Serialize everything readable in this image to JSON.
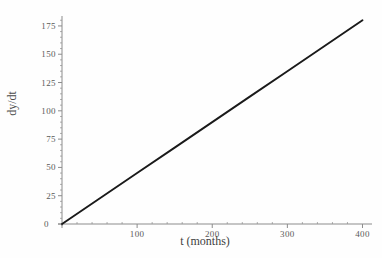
{
  "chart_data": {
    "type": "line",
    "title": "",
    "subtitle": "",
    "xlabel": "t (months)",
    "ylabel": "dy/dt",
    "xlim": [
      0,
      410
    ],
    "ylim": [
      0,
      182
    ],
    "grid": false,
    "legend": null,
    "x_ticks": [
      0,
      100,
      200,
      300,
      400
    ],
    "x_tick_labels": [
      "0",
      "100",
      "200",
      "300",
      "400"
    ],
    "y_ticks": [
      0,
      25,
      50,
      75,
      100,
      125,
      150,
      175
    ],
    "y_tick_labels": [
      "0",
      "25",
      "50",
      "75",
      "100",
      "125",
      "150",
      "175"
    ],
    "x_minor_tick_step": 20,
    "y_minor_tick_step": 5,
    "origin_label": "0",
    "series": [
      {
        "name": "dy/dt",
        "color": "#1a1a1a",
        "x": [
          0,
          50,
          100,
          150,
          200,
          250,
          300,
          350,
          400
        ],
        "y": [
          0,
          22.5,
          45,
          67.5,
          90,
          112.5,
          135,
          157.5,
          180
        ]
      }
    ],
    "slope": 0.45,
    "intercept": 0
  },
  "style": {
    "axis_color": "#8c8c8c",
    "line_color": "#1a1a1a",
    "text_color": "#555555",
    "background": "#ffffff"
  }
}
